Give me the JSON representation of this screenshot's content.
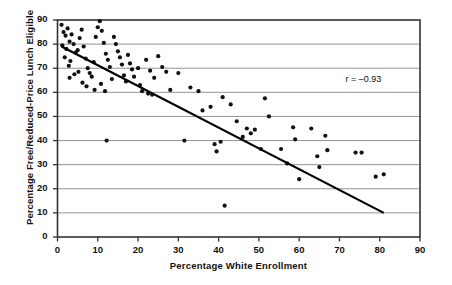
{
  "chart_data": {
    "type": "scatter",
    "title": "",
    "xlabel": "Percentage White Enrollment",
    "ylabel": "Percentage  Free/Reduced-Price Lunch Eligible",
    "xlim": [
      0,
      90
    ],
    "ylim": [
      0,
      90
    ],
    "xticks": [
      0,
      10,
      20,
      30,
      40,
      50,
      60,
      70,
      80,
      90
    ],
    "yticks": [
      0,
      10,
      20,
      30,
      40,
      50,
      60,
      70,
      80,
      90
    ],
    "grid": "horizontal",
    "legend": "none",
    "annotations": [
      {
        "name": "correlation",
        "text": "r = –0.93",
        "x": 72,
        "y": 65
      }
    ],
    "trendline": {
      "type": "linear",
      "x_start": 1.0,
      "y_start": 79.0,
      "x_end": 81.0,
      "y_end": 10.0,
      "color": "#000000",
      "width": 2.2
    },
    "marker": {
      "shape": "circle",
      "size": 2.1,
      "color": "#111111"
    },
    "points": [
      [
        1.0,
        88.0
      ],
      [
        1.5,
        85.0
      ],
      [
        2.0,
        83.5
      ],
      [
        2.5,
        86.5
      ],
      [
        3.0,
        81.0
      ],
      [
        3.5,
        84.0
      ],
      [
        1.2,
        79.5
      ],
      [
        2.2,
        78.0
      ],
      [
        4.0,
        80.0
      ],
      [
        4.5,
        76.5
      ],
      [
        1.8,
        74.5
      ],
      [
        3.2,
        73.0
      ],
      [
        2.8,
        71.0
      ],
      [
        5.0,
        77.5
      ],
      [
        5.5,
        82.5
      ],
      [
        6.0,
        86.0
      ],
      [
        6.5,
        79.0
      ],
      [
        7.0,
        74.0
      ],
      [
        7.5,
        70.0
      ],
      [
        8.0,
        68.0
      ],
      [
        5.2,
        68.5
      ],
      [
        4.2,
        67.5
      ],
      [
        3.0,
        66.0
      ],
      [
        6.2,
        64.0
      ],
      [
        7.2,
        62.5
      ],
      [
        8.5,
        66.5
      ],
      [
        9.0,
        72.5
      ],
      [
        9.5,
        83.0
      ],
      [
        10.0,
        87.0
      ],
      [
        10.5,
        89.5
      ],
      [
        11.0,
        85.5
      ],
      [
        11.5,
        80.5
      ],
      [
        12.0,
        76.0
      ],
      [
        12.5,
        73.5
      ],
      [
        13.0,
        70.5
      ],
      [
        13.5,
        65.5
      ],
      [
        9.2,
        61.0
      ],
      [
        10.8,
        63.5
      ],
      [
        11.8,
        60.5
      ],
      [
        14.0,
        83.0
      ],
      [
        14.5,
        80.0
      ],
      [
        15.0,
        77.0
      ],
      [
        15.5,
        74.5
      ],
      [
        16.0,
        71.5
      ],
      [
        16.5,
        67.0
      ],
      [
        17.0,
        64.5
      ],
      [
        12.2,
        40.0
      ],
      [
        17.5,
        75.5
      ],
      [
        18.0,
        72.0
      ],
      [
        18.5,
        69.5
      ],
      [
        19.0,
        66.5
      ],
      [
        20.0,
        70.0
      ],
      [
        20.5,
        63.0
      ],
      [
        21.0,
        60.5
      ],
      [
        22.0,
        73.5
      ],
      [
        23.0,
        69.0
      ],
      [
        24.0,
        66.0
      ],
      [
        25.0,
        75.0
      ],
      [
        26.0,
        70.5
      ],
      [
        27.0,
        68.5
      ],
      [
        22.5,
        59.5
      ],
      [
        23.5,
        59.0
      ],
      [
        28.0,
        61.0
      ],
      [
        30.0,
        68.0
      ],
      [
        31.5,
        40.0
      ],
      [
        33.0,
        62.0
      ],
      [
        35.0,
        60.5
      ],
      [
        36.0,
        52.5
      ],
      [
        38.0,
        54.0
      ],
      [
        39.0,
        38.5
      ],
      [
        39.5,
        35.5
      ],
      [
        40.5,
        39.5
      ],
      [
        41.0,
        58.0
      ],
      [
        41.5,
        13.0
      ],
      [
        43.0,
        55.0
      ],
      [
        44.5,
        48.0
      ],
      [
        46.0,
        41.5
      ],
      [
        47.0,
        45.0
      ],
      [
        48.0,
        43.0
      ],
      [
        49.0,
        44.5
      ],
      [
        50.5,
        36.5
      ],
      [
        51.5,
        57.5
      ],
      [
        52.5,
        50.0
      ],
      [
        55.5,
        36.5
      ],
      [
        57.0,
        30.5
      ],
      [
        58.5,
        45.5
      ],
      [
        59.0,
        40.5
      ],
      [
        60.0,
        24.0
      ],
      [
        63.0,
        45.0
      ],
      [
        64.5,
        33.5
      ],
      [
        65.0,
        29.0
      ],
      [
        66.5,
        42.0
      ],
      [
        67.0,
        36.0
      ],
      [
        74.0,
        35.0
      ],
      [
        75.5,
        35.0
      ],
      [
        79.0,
        25.0
      ],
      [
        81.0,
        26.0
      ]
    ]
  },
  "axis": {
    "frame_color": "#333333",
    "grid_color": "#888888"
  }
}
